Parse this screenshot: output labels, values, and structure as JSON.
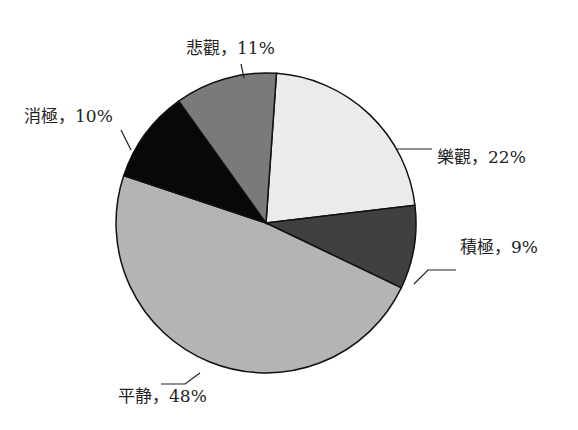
{
  "chart_data": {
    "type": "pie",
    "title": "",
    "start_angle_deg": 4,
    "center": [
      266,
      223
    ],
    "radius": 150,
    "slices": [
      {
        "label": "樂觀",
        "value": 22,
        "display": "樂觀，22%",
        "color": "#ebebeb",
        "label_pos": [
          437,
          163
        ],
        "anchor": "start",
        "leader": [
          [
            396,
            149
          ],
          [
            432,
            149
          ]
        ]
      },
      {
        "label": "積極",
        "value": 9,
        "display": "積極，9%",
        "color": "#404040",
        "label_pos": [
          460,
          253
        ],
        "anchor": "start",
        "leader": [
          [
            414,
            284
          ],
          [
            428,
            270
          ],
          [
            456,
            270
          ]
        ]
      },
      {
        "label": "平静",
        "value": 48,
        "display": "平静，48%",
        "color": "#b4b4b4",
        "label_pos": [
          118,
          402
        ],
        "anchor": "start",
        "leader": [
          [
            200,
            373
          ],
          [
            185,
            384
          ],
          [
            161,
            384
          ]
        ]
      },
      {
        "label": "消極",
        "value": 10,
        "display": "消極，10%",
        "color": "#080808",
        "label_pos": [
          24,
          122
        ],
        "anchor": "start",
        "leader": [
          [
            121,
            130
          ],
          [
            131,
            150
          ]
        ]
      },
      {
        "label": "悲觀",
        "value": 11,
        "display": "悲觀，11%",
        "color": "#7a7a7a",
        "label_pos": [
          186,
          54
        ],
        "anchor": "start",
        "leader": [
          [
            241,
            64
          ],
          [
            244,
            78
          ]
        ]
      }
    ]
  }
}
